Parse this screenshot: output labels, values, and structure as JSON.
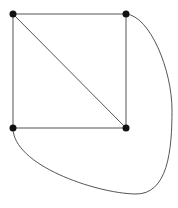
{
  "diagram": {
    "type": "graph",
    "colors": {
      "edge": "#555555",
      "node": "#111111",
      "background": "#ffffff"
    },
    "nodes": [
      {
        "id": "A",
        "x": 13,
        "y": 14
      },
      {
        "id": "B",
        "x": 126,
        "y": 14
      },
      {
        "id": "C",
        "x": 13,
        "y": 128
      },
      {
        "id": "D",
        "x": 126,
        "y": 128
      }
    ],
    "edges": [
      {
        "from": "A",
        "to": "B",
        "kind": "straight"
      },
      {
        "from": "A",
        "to": "C",
        "kind": "straight"
      },
      {
        "from": "A",
        "to": "D",
        "kind": "straight"
      },
      {
        "from": "B",
        "to": "D",
        "kind": "straight"
      },
      {
        "from": "C",
        "to": "D",
        "kind": "straight"
      },
      {
        "from": "B",
        "to": "C",
        "kind": "curved"
      }
    ]
  }
}
